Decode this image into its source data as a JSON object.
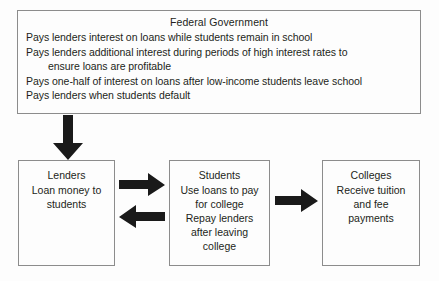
{
  "diagram": {
    "background_color": "#fdfdfd",
    "text_color": "#231f20",
    "box_border_color": "#8c8c8c",
    "arrow_color": "#1a1a1a"
  },
  "federal_government": {
    "title": "Federal Government",
    "lines": [
      "Pays lenders interest on loans while students remain in school",
      "Pays lenders additional interest during periods of high interest rates to",
      "ensure loans are profitable",
      "Pays one-half of interest on loans after low-income students leave school",
      "Pays lenders when students default"
    ]
  },
  "lenders": {
    "title": "Lenders",
    "lines": [
      "Loan money to",
      "students"
    ]
  },
  "students": {
    "title": "Students",
    "lines": [
      "Use loans to pay",
      "for college",
      "Repay lenders",
      "after leaving",
      "college"
    ]
  },
  "colleges": {
    "title": "Colleges",
    "lines": [
      "Receive tuition",
      "and fee",
      "payments"
    ]
  },
  "arrows": [
    {
      "name": "government-to-lenders",
      "direction": "down"
    },
    {
      "name": "lenders-to-students",
      "direction": "right"
    },
    {
      "name": "students-to-lenders",
      "direction": "left"
    },
    {
      "name": "students-to-colleges",
      "direction": "right"
    }
  ]
}
